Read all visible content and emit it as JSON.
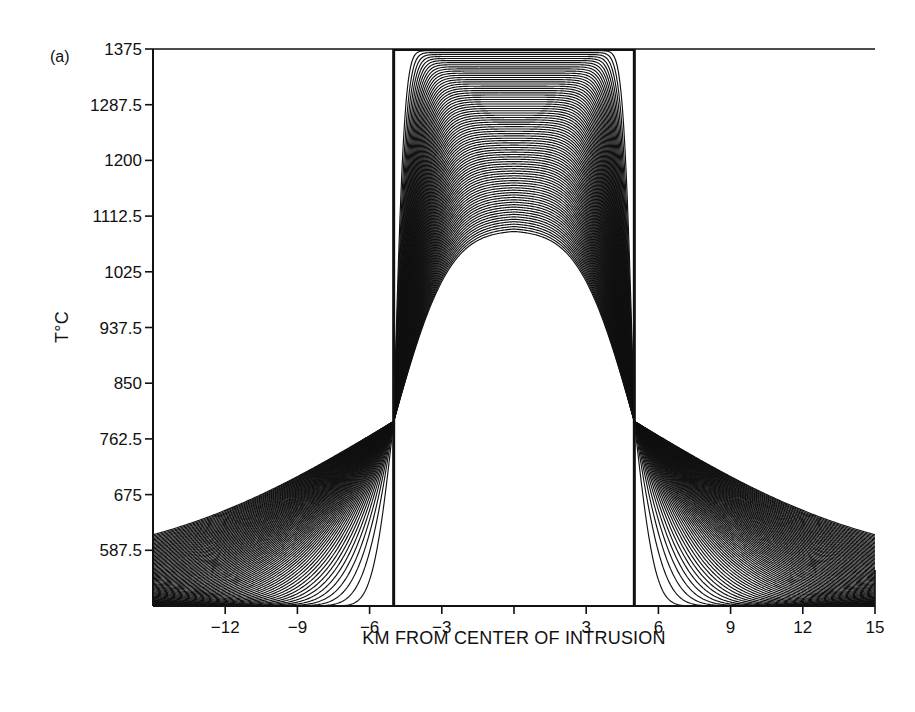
{
  "chart_data": {
    "type": "line",
    "panel_label": "(a)",
    "title": "",
    "xlabel": "KM FROM CENTER OF INTRUSION",
    "ylabel": "T°C",
    "xlim": [
      -15,
      15
    ],
    "ylim": [
      500,
      1375
    ],
    "x_ticks": [
      -12,
      -9,
      -6,
      -3,
      0,
      3,
      6,
      9,
      12,
      15
    ],
    "x_tick_labels": [
      "-12",
      "-9",
      "-6",
      "-3",
      "",
      "3",
      "6",
      "9",
      "12",
      "15"
    ],
    "y_ticks": [
      1375,
      1287.5,
      1200,
      1112.5,
      1025,
      937.5,
      850,
      762.5,
      675,
      587.5
    ],
    "y_tick_labels": [
      "1375",
      "1287.5",
      "1200",
      "1112.5",
      "1025",
      "937.5",
      "850",
      "762.5",
      "675",
      "587.5"
    ],
    "grid": false,
    "legend": null,
    "intrusion_half_width_km": 5,
    "initial_magma_temperature": 1375,
    "initial_host_temperature": 500,
    "contact_temperature": 790,
    "final_center_temperature": 1090,
    "final_profile_edge_temperature_at_15km": 565,
    "series_count_approx": 80,
    "series_sample": [
      {
        "name": "early",
        "x": [
          -15,
          -5,
          -5,
          0,
          5,
          5,
          15
        ],
        "y": [
          500,
          500,
          1375,
          1375,
          1375,
          500,
          500
        ]
      },
      {
        "name": "intermediate",
        "x": [
          -15,
          -10,
          -6,
          -5,
          -3,
          0,
          3,
          5,
          6,
          10,
          15
        ],
        "y": [
          500,
          505,
          600,
          790,
          1250,
          1330,
          1250,
          790,
          600,
          505,
          500
        ]
      },
      {
        "name": "latest",
        "x": [
          -15,
          -12,
          -9,
          -6,
          -5,
          -3,
          0,
          3,
          5,
          6,
          9,
          12,
          15
        ],
        "y": [
          565,
          610,
          670,
          755,
          790,
          960,
          1090,
          960,
          790,
          755,
          670,
          610,
          565
        ]
      }
    ]
  },
  "colors": {
    "ink": "#111111",
    "background": "#ffffff"
  }
}
